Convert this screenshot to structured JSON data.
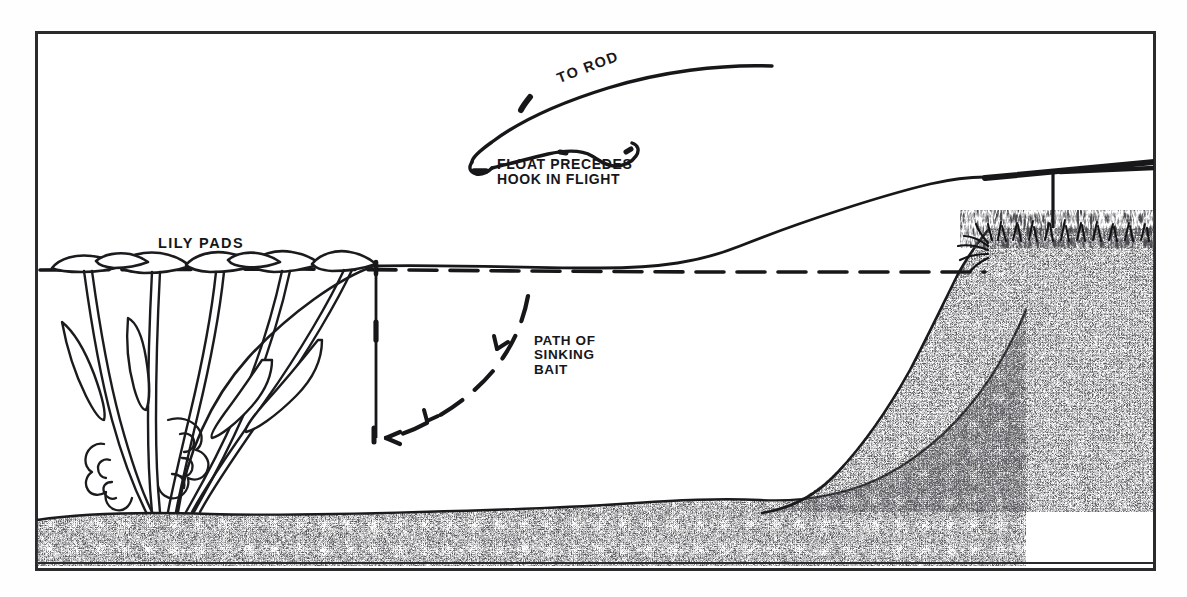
{
  "figure": {
    "style": "black and white line illustration with stippled substrate",
    "border_color": "#2b2b2e",
    "ink_color": "#17171a"
  },
  "labels": {
    "lily_pads": "LILY PADS",
    "to_rod": "TO ROD",
    "float_precedes": "FLOAT PRECEDES\nHOOK IN FLIGHT",
    "path_of_sinking_bait": "PATH OF\nSINKING\nBAIT"
  },
  "elements": {
    "water_surface": "dashed-water-line",
    "cast_line": "arcing-fishing-line-to-rod",
    "float": "float-at-apex-of-cast",
    "bait_path": "dashed-curved-arrow-descending-left",
    "vertical_line": "float-line-hanging-to-hook",
    "rod": "fishing-rod-over-bank",
    "rod_drop_line": "line-from-rod-tip-to-bank",
    "bank": "stippled-sloping-bank-right",
    "lake_bed": "stippled-lake-bottom",
    "grass": "grass-tufts-on-bank-top",
    "plants": "lily-pad-stalks-and-leaves"
  },
  "geometry": {
    "frame": {
      "x": 36,
      "y": 32,
      "width": 1119,
      "height": 538
    },
    "water_surface_y": 272,
    "lake_bed_top_y": 512,
    "bank_crest_x": 985,
    "rod_tip_y": 178,
    "float_line_x": 376
  }
}
